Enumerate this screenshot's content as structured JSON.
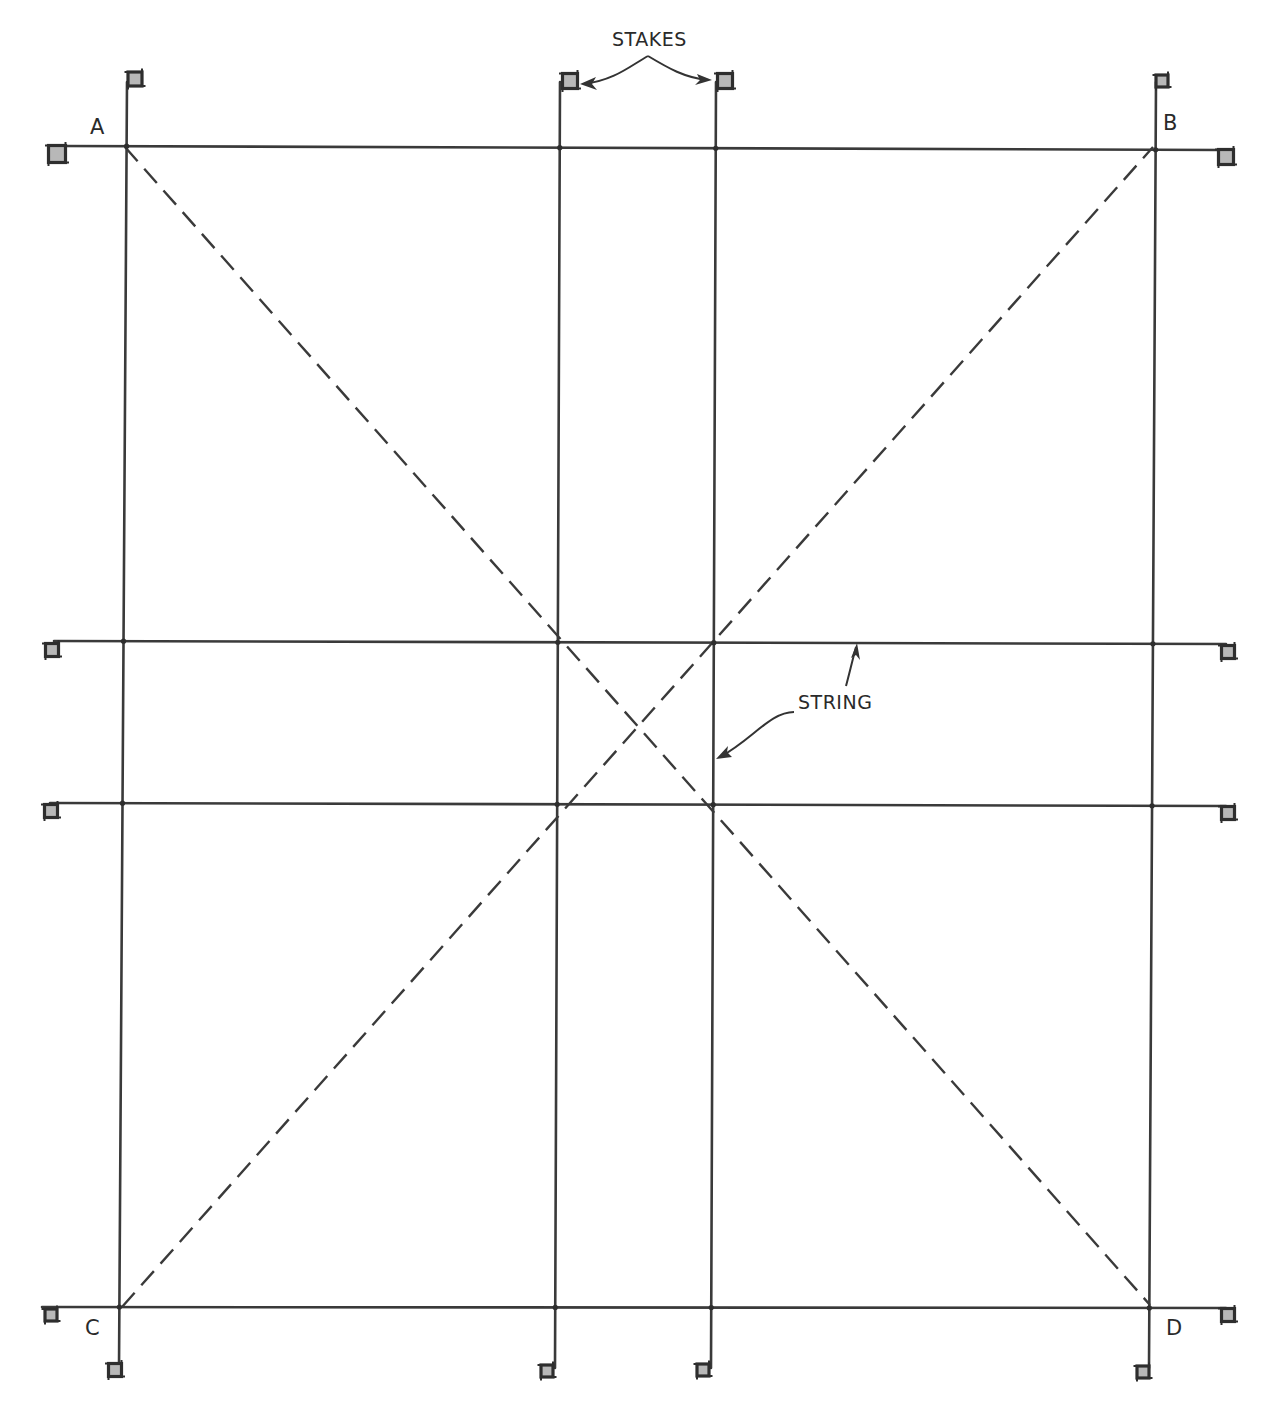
{
  "diagram": {
    "stroke_color": "#3a3a3a",
    "stake_fill": "#b8b8b8",
    "corners": [
      {
        "id": "A",
        "label": "A",
        "x": 125,
        "y": 147,
        "label_x": 90,
        "label_y": 134
      },
      {
        "id": "B",
        "label": "B",
        "x": 1153,
        "y": 147,
        "label_x": 1163,
        "label_y": 130
      },
      {
        "id": "C",
        "label": "C",
        "x": 122,
        "y": 1307,
        "label_x": 85,
        "label_y": 1335
      },
      {
        "id": "D",
        "label": "D",
        "x": 1150,
        "y": 1305,
        "label_x": 1166,
        "label_y": 1335
      }
    ],
    "vertical_strings": [
      {
        "name": "string-ac",
        "x1": 127,
        "y1": 82,
        "x2": 119,
        "y2": 1368
      },
      {
        "name": "string-left-inner",
        "x1": 560,
        "y1": 82,
        "x2": 555,
        "y2": 1368
      },
      {
        "name": "string-right-inner",
        "x1": 716,
        "y1": 82,
        "x2": 711,
        "y2": 1368
      },
      {
        "name": "string-bd",
        "x1": 1156,
        "y1": 82,
        "x2": 1149,
        "y2": 1368
      }
    ],
    "horizontal_strings": [
      {
        "name": "string-ab",
        "x1": 62,
        "y1": 146,
        "x2": 1222,
        "y2": 150
      },
      {
        "name": "string-upper-inner",
        "x1": 54,
        "y1": 641,
        "x2": 1226,
        "y2": 644
      },
      {
        "name": "string-lower-inner",
        "x1": 50,
        "y1": 803,
        "x2": 1226,
        "y2": 806
      },
      {
        "name": "string-cd",
        "x1": 42,
        "y1": 1307,
        "x2": 1226,
        "y2": 1308
      }
    ],
    "diagonals": [
      {
        "name": "diagonal-ad",
        "x1": 125,
        "y1": 147,
        "x2": 1150,
        "y2": 1305
      },
      {
        "name": "diagonal-cb",
        "x1": 122,
        "y1": 1307,
        "x2": 1153,
        "y2": 147
      }
    ],
    "stakes": [
      {
        "name": "stake-a-top",
        "x": 135,
        "y": 79,
        "size": 14
      },
      {
        "name": "stake-a-left",
        "x": 57,
        "y": 154,
        "size": 17
      },
      {
        "name": "stake-inner-left-top",
        "x": 570,
        "y": 81,
        "size": 15
      },
      {
        "name": "stake-inner-right-top",
        "x": 725,
        "y": 81,
        "size": 15
      },
      {
        "name": "stake-b-top",
        "x": 1162,
        "y": 81,
        "size": 12
      },
      {
        "name": "stake-b-right",
        "x": 1226,
        "y": 157,
        "size": 15
      },
      {
        "name": "stake-upper-left",
        "x": 52,
        "y": 650,
        "size": 13
      },
      {
        "name": "stake-upper-right",
        "x": 1228,
        "y": 652,
        "size": 13
      },
      {
        "name": "stake-lower-left",
        "x": 51,
        "y": 811,
        "size": 13
      },
      {
        "name": "stake-lower-right",
        "x": 1228,
        "y": 813,
        "size": 13
      },
      {
        "name": "stake-c-left",
        "x": 51,
        "y": 1315,
        "size": 12
      },
      {
        "name": "stake-d-right",
        "x": 1228,
        "y": 1315,
        "size": 13
      },
      {
        "name": "stake-c-bottom",
        "x": 115,
        "y": 1370,
        "size": 13
      },
      {
        "name": "stake-inner-left-bottom",
        "x": 547,
        "y": 1371,
        "size": 12
      },
      {
        "name": "stake-inner-right-bottom",
        "x": 703,
        "y": 1370,
        "size": 12
      },
      {
        "name": "stake-d-bottom",
        "x": 1143,
        "y": 1372,
        "size": 12
      }
    ],
    "annotations": {
      "stakes_label": {
        "text": "STAKES",
        "x": 612,
        "y": 46
      },
      "string_label": {
        "text": "STRING",
        "x": 798,
        "y": 709
      }
    }
  }
}
